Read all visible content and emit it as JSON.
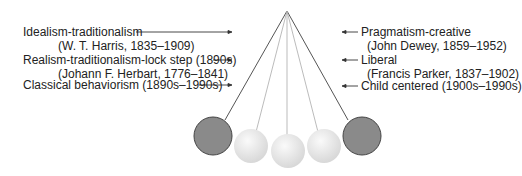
{
  "left_labels": [
    {
      "text": "Idealism-traditionalism"
    },
    {
      "text": "(W. T. Harris, 1835–1909)"
    },
    {
      "text": "Realism-traditionalism-lock step (1890s)"
    },
    {
      "text": "(Johann F. Herbart, 1776–1841)"
    },
    {
      "text": "Classical behaviorism (1890s–1990s)"
    }
  ],
  "right_labels": [
    {
      "text": "Pragmatism-creative"
    },
    {
      "text": "(John Dewey, 1859–1952)"
    },
    {
      "text": "Liberal"
    },
    {
      "text": "(Francis Parker, 1837–1902)"
    },
    {
      "text": "Child centered (1900s–1990s)"
    }
  ],
  "colors": {
    "dark_ball": "#8a8a8a",
    "light_ball": "#e4e4e4",
    "line": "#444444"
  }
}
